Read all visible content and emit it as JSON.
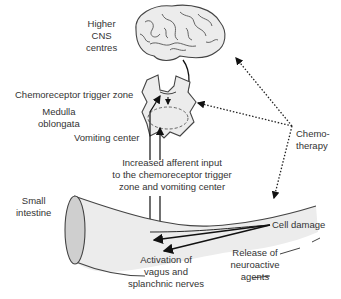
{
  "diagram": {
    "labels": {
      "higher_cns": [
        "Higher",
        "CNS",
        "centres"
      ],
      "ctz": "Chemoreceptor trigger zone",
      "medulla": [
        "Medulla",
        "oblongata"
      ],
      "vomiting_center": "Vomiting center",
      "afferent": [
        "Increased afferent input",
        "to the chemoreceptor trigger",
        "zone and vomiting center"
      ],
      "small_intestine": [
        "Small",
        "intestine"
      ],
      "chemotherapy": [
        "Chemo-",
        "therapy"
      ],
      "cell_damage": "Cell damage",
      "activation": [
        "Activation of",
        "vagus and",
        "splanchnic nerves"
      ],
      "release": [
        "Release of",
        "neuroactive",
        "agents"
      ]
    },
    "colors": {
      "organ_fill": "#ececec",
      "outline": "#444444",
      "arrow": "#111111",
      "cut_face": "#cfcfcf"
    }
  }
}
